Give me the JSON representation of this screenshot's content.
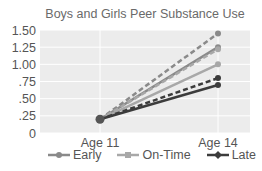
{
  "chart_data": {
    "type": "line",
    "title": "Boys and Girls Peer Substance Use",
    "xlabel": "",
    "ylabel": "",
    "categories": [
      "Age 11",
      "Age 14"
    ],
    "ylim": [
      0,
      1.5
    ],
    "yticks": [
      "0",
      ".25",
      ".50",
      ".75",
      "1.00",
      "1.25",
      "1.50"
    ],
    "grid": true,
    "legend_position": "bottom",
    "series": [
      {
        "name": "Early (dashed)",
        "style": "dashed",
        "color": "#8a8a8a",
        "values": [
          0.2,
          1.45
        ]
      },
      {
        "name": "Early",
        "style": "solid",
        "color": "#8a8a8a",
        "values": [
          0.2,
          1.25
        ]
      },
      {
        "name": "On-Time (dashed)",
        "style": "dashed",
        "color": "#a8a8a8",
        "values": [
          0.2,
          1.22
        ]
      },
      {
        "name": "On-Time",
        "style": "solid",
        "color": "#a8a8a8",
        "values": [
          0.2,
          1.0
        ]
      },
      {
        "name": "Late (dashed)",
        "style": "dashed",
        "color": "#3c3c3c",
        "values": [
          0.2,
          0.8
        ]
      },
      {
        "name": "Late",
        "style": "solid",
        "color": "#3c3c3c",
        "values": [
          0.2,
          0.7
        ]
      }
    ]
  },
  "legend": [
    {
      "label": "Early",
      "color": "#8a8a8a",
      "marker": "circle"
    },
    {
      "label": "On-Time",
      "color": "#a8a8a8",
      "marker": "square"
    },
    {
      "label": "Late",
      "color": "#3c3c3c",
      "marker": "diamond"
    }
  ],
  "colors": {
    "plot_bg": "#ececec",
    "grid": "#ffffff",
    "text": "#555555"
  }
}
